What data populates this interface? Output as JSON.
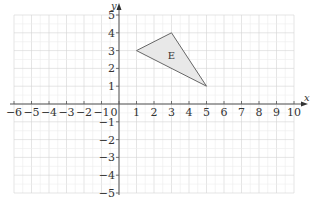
{
  "chart_data": {
    "type": "scatter",
    "title": "",
    "xlabel": "x",
    "ylabel": "y",
    "xlim": [
      -6,
      10
    ],
    "ylim": [
      -5,
      5
    ],
    "grid": true,
    "x_ticks": [
      -6,
      -5,
      -4,
      -3,
      -2,
      -1,
      0,
      1,
      2,
      3,
      4,
      5,
      6,
      7,
      8,
      9,
      10
    ],
    "y_ticks": [
      -5,
      -4,
      -3,
      -2,
      -1,
      1,
      2,
      3,
      4,
      5
    ],
    "shapes": [
      {
        "name": "E",
        "type": "triangle",
        "vertices": [
          [
            1,
            3
          ],
          [
            3,
            4
          ],
          [
            5,
            1
          ]
        ],
        "fill": "#e8e8e8",
        "stroke": "#666666"
      }
    ]
  },
  "labels": {
    "x_axis": "x",
    "y_axis": "y",
    "origin": "0",
    "shape_label": "E"
  }
}
